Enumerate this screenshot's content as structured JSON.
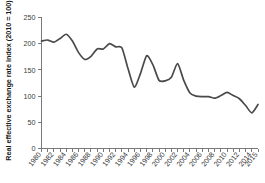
{
  "chart_data": {
    "type": "line",
    "title": "",
    "xlabel": "",
    "ylabel": "Real effective exchange rate index (2010 = 100)",
    "ylim": [
      0,
      250
    ],
    "yticks": [
      0,
      50,
      100,
      150,
      200,
      250
    ],
    "ytick_labels": [
      "0",
      "50",
      "100",
      "150",
      "200",
      "250"
    ],
    "xlim": [
      1980,
      2015
    ],
    "xtick_labels": [
      "1980",
      "1982",
      "1984",
      "1986",
      "1988",
      "1990",
      "1992",
      "1994",
      "1996",
      "1998",
      "2000",
      "2002",
      "2004",
      "2006",
      "2008",
      "2010",
      "2012",
      "2014",
      "2015"
    ],
    "grid": false,
    "legend": false,
    "line_color": "#4a4a4a",
    "x": [
      1980,
      1981,
      1982,
      1983,
      1984,
      1985,
      1986,
      1987,
      1988,
      1989,
      1990,
      1991,
      1992,
      1993,
      1994,
      1995,
      1996,
      1997,
      1998,
      1999,
      2000,
      2001,
      2002,
      2003,
      2004,
      2005,
      2006,
      2007,
      2008,
      2009,
      2010,
      2011,
      2012,
      2013,
      2014,
      2015
    ],
    "values": [
      205,
      207,
      203,
      210,
      218,
      205,
      183,
      170,
      176,
      190,
      190,
      200,
      194,
      192,
      152,
      117,
      143,
      177,
      160,
      130,
      129,
      136,
      162,
      130,
      106,
      100,
      99,
      99,
      96,
      101,
      107,
      101,
      95,
      82,
      68,
      84
    ],
    "series": [
      {
        "name": "Real effective exchange rate index",
        "values": [
          205,
          207,
          203,
          210,
          218,
          205,
          183,
          170,
          176,
          190,
          190,
          200,
          194,
          192,
          152,
          117,
          143,
          177,
          160,
          130,
          129,
          136,
          162,
          130,
          106,
          100,
          99,
          99,
          96,
          101,
          107,
          101,
          95,
          82,
          68,
          84
        ]
      }
    ]
  }
}
